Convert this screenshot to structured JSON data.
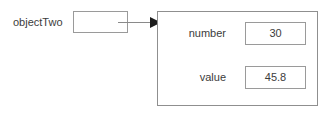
{
  "diagram": {
    "type": "object-reference-diagram",
    "canvas": {
      "width": 331,
      "height": 118,
      "background": "#ffffff"
    },
    "stroke_color": "#9a9a9a",
    "text_color": "#3c3c3c",
    "variable": {
      "label": "objectTwo",
      "reference_box_value": ""
    },
    "arrow": {
      "name": "reference-arrow",
      "direction": "right"
    },
    "object": {
      "fields": [
        {
          "label": "number",
          "value": "30"
        },
        {
          "label": "value",
          "value": "45.8"
        }
      ]
    }
  }
}
